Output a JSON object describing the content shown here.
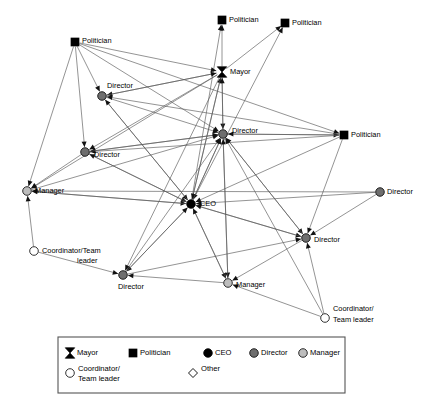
{
  "figure": {
    "type": "network-diagram",
    "title": "",
    "background_color": "#ffffff",
    "edge_color": "#5a5a5a"
  },
  "colors": {
    "mayor": "#000000",
    "politician": "#000000",
    "ceo": "#000000",
    "director": "#6e6e6e",
    "manager": "#bdbdbd",
    "coordinator": "#ffffff",
    "other": "#ffffff",
    "outline": "#000000",
    "edge": "#5a5a5a"
  },
  "nodes": [
    {
      "id": "pol_top",
      "label": "Politician",
      "role": "politician",
      "shape": "square",
      "x": 222,
      "y": 20,
      "label_dx": 7,
      "label_dy": 0,
      "anchor": "start"
    },
    {
      "id": "pol_topright",
      "label": "Politician",
      "role": "politician",
      "shape": "square",
      "x": 285,
      "y": 23,
      "label_dx": 7,
      "label_dy": 0,
      "anchor": "start"
    },
    {
      "id": "pol_left",
      "label": "Politician",
      "role": "politician",
      "shape": "square",
      "x": 75,
      "y": 42,
      "label_dx": 7,
      "label_dy": -1,
      "anchor": "start"
    },
    {
      "id": "mayor",
      "label": "Mayor",
      "role": "mayor",
      "shape": "hourglass",
      "x": 222,
      "y": 72,
      "label_dx": 8,
      "label_dy": 0,
      "anchor": "start"
    },
    {
      "id": "dir_upperleft",
      "label": "Director",
      "role": "director",
      "shape": "circle",
      "x": 102,
      "y": 96,
      "label_dx": 5,
      "label_dy": -10,
      "anchor": "start"
    },
    {
      "id": "dir_center",
      "label": "Director",
      "role": "director",
      "shape": "circle",
      "x": 223,
      "y": 134,
      "label_dx": 9,
      "label_dy": -3,
      "anchor": "start"
    },
    {
      "id": "pol_right",
      "label": "Politician",
      "role": "politician",
      "shape": "square",
      "x": 344,
      "y": 135,
      "label_dx": 7,
      "label_dy": 0,
      "anchor": "start"
    },
    {
      "id": "dir_left",
      "label": "Director",
      "role": "director",
      "shape": "circle",
      "x": 85,
      "y": 152,
      "label_dx": 9,
      "label_dy": 3,
      "anchor": "start"
    },
    {
      "id": "manager_left",
      "label": "Manager",
      "role": "manager",
      "shape": "circle",
      "x": 27,
      "y": 191,
      "label_dx": 8,
      "label_dy": 0,
      "anchor": "start"
    },
    {
      "id": "dir_farright",
      "label": "Director",
      "role": "director",
      "shape": "circle",
      "x": 380,
      "y": 192,
      "label_dx": 7,
      "label_dy": 0,
      "anchor": "start"
    },
    {
      "id": "ceo",
      "label": "CEO",
      "role": "ceo",
      "shape": "circle",
      "x": 191,
      "y": 204,
      "label_dx": 9,
      "label_dy": 0,
      "anchor": "start"
    },
    {
      "id": "dir_right",
      "label": "Director",
      "role": "director",
      "shape": "circle",
      "x": 306,
      "y": 238,
      "label_dx": 8,
      "label_dy": 2,
      "anchor": "start"
    },
    {
      "id": "coord_left",
      "label": "Coordinator/Team",
      "role": "coordinator",
      "shape": "circle",
      "x": 34,
      "y": 251,
      "label_dx": 8,
      "label_dy": 0,
      "anchor": "start",
      "label2": "leader",
      "label2_dx": 43,
      "label2_dy": 10
    },
    {
      "id": "dir_bottom",
      "label": "Director",
      "role": "director",
      "shape": "circle",
      "x": 123,
      "y": 275,
      "label_dx": -5,
      "label_dy": 12,
      "anchor": "start"
    },
    {
      "id": "manager_bottom",
      "label": "Manager",
      "role": "manager",
      "shape": "circle",
      "x": 228,
      "y": 283,
      "label_dx": 8,
      "label_dy": 2,
      "anchor": "start"
    },
    {
      "id": "coord_right",
      "label": "Coordinator/",
      "role": "coordinator",
      "shape": "circle",
      "x": 325,
      "y": 318,
      "label_dx": 8,
      "label_dy": -9,
      "anchor": "start",
      "label2": "Team leader",
      "label2_dx": 8,
      "label2_dy": 2
    }
  ],
  "edges": [
    {
      "from": "mayor",
      "to": "pol_top",
      "arrow": "to"
    },
    {
      "from": "mayor",
      "to": "pol_topright",
      "arrow": "to"
    },
    {
      "from": "ceo",
      "to": "pol_topright",
      "arrow": "to"
    },
    {
      "from": "ceo",
      "to": "mayor",
      "arrow": "to"
    },
    {
      "from": "ceo",
      "to": "pol_top",
      "arrow": "to"
    },
    {
      "from": "pol_left",
      "to": "mayor",
      "arrow": "to"
    },
    {
      "from": "pol_left",
      "to": "dir_upperleft",
      "arrow": "to"
    },
    {
      "from": "pol_left",
      "to": "dir_left",
      "arrow": "to"
    },
    {
      "from": "pol_left",
      "to": "manager_left",
      "arrow": "to"
    },
    {
      "from": "pol_left",
      "to": "dir_center",
      "arrow": "to"
    },
    {
      "from": "pol_left",
      "to": "pol_right",
      "arrow": "to"
    },
    {
      "from": "mayor",
      "to": "dir_upperleft",
      "arrow": "to"
    },
    {
      "from": "mayor",
      "to": "dir_center",
      "arrow": "to"
    },
    {
      "from": "mayor",
      "to": "dir_left",
      "arrow": "to"
    },
    {
      "from": "mayor",
      "to": "manager_left",
      "arrow": "to"
    },
    {
      "from": "mayor",
      "to": "ceo",
      "arrow": "to"
    },
    {
      "from": "mayor",
      "to": "dir_bottom",
      "arrow": "to"
    },
    {
      "from": "dir_upperleft",
      "to": "ceo",
      "arrow": "to"
    },
    {
      "from": "dir_upperleft",
      "to": "dir_center",
      "arrow": "to"
    },
    {
      "from": "dir_upperleft",
      "to": "mayor",
      "arrow": "to"
    },
    {
      "from": "dir_center",
      "to": "mayor",
      "arrow": "to"
    },
    {
      "from": "dir_center",
      "to": "ceo",
      "arrow": "to"
    },
    {
      "from": "dir_center",
      "to": "pol_right",
      "arrow": "to"
    },
    {
      "from": "dir_center",
      "to": "dir_left",
      "arrow": "to"
    },
    {
      "from": "dir_center",
      "to": "dir_right",
      "arrow": "to"
    },
    {
      "from": "dir_center",
      "to": "manager_bottom",
      "arrow": "to"
    },
    {
      "from": "pol_right",
      "to": "dir_center",
      "arrow": "to"
    },
    {
      "from": "pol_right",
      "to": "ceo",
      "arrow": "to"
    },
    {
      "from": "pol_right",
      "to": "dir_upperleft",
      "arrow": "to"
    },
    {
      "from": "pol_right",
      "to": "dir_left",
      "arrow": "to"
    },
    {
      "from": "pol_right",
      "to": "dir_right",
      "arrow": "to"
    },
    {
      "from": "dir_left",
      "to": "ceo",
      "arrow": "to"
    },
    {
      "from": "dir_left",
      "to": "dir_center",
      "arrow": "to"
    },
    {
      "from": "dir_left",
      "to": "manager_left",
      "arrow": "to"
    },
    {
      "from": "manager_left",
      "to": "ceo",
      "arrow": "to"
    },
    {
      "from": "manager_left",
      "to": "dir_center",
      "arrow": "to"
    },
    {
      "from": "dir_farright",
      "to": "ceo",
      "arrow": "to"
    },
    {
      "from": "dir_farright",
      "to": "manager_left",
      "arrow": "to"
    },
    {
      "from": "dir_farright",
      "to": "dir_right",
      "arrow": "to"
    },
    {
      "from": "ceo",
      "to": "dir_center",
      "arrow": "to"
    },
    {
      "from": "ceo",
      "to": "dir_right",
      "arrow": "to"
    },
    {
      "from": "ceo",
      "to": "dir_bottom",
      "arrow": "to"
    },
    {
      "from": "ceo",
      "to": "manager_bottom",
      "arrow": "to"
    },
    {
      "from": "ceo",
      "to": "dir_left",
      "arrow": "to"
    },
    {
      "from": "ceo",
      "to": "dir_upperleft",
      "arrow": "to"
    },
    {
      "from": "ceo",
      "to": "manager_left",
      "arrow": "to"
    },
    {
      "from": "dir_right",
      "to": "ceo",
      "arrow": "to"
    },
    {
      "from": "dir_right",
      "to": "dir_center",
      "arrow": "to"
    },
    {
      "from": "dir_right",
      "to": "manager_bottom",
      "arrow": "to"
    },
    {
      "from": "coord_left",
      "to": "manager_left",
      "arrow": "to"
    },
    {
      "from": "coord_left",
      "to": "dir_bottom",
      "arrow": "to"
    },
    {
      "from": "dir_bottom",
      "to": "ceo",
      "arrow": "to"
    },
    {
      "from": "dir_bottom",
      "to": "dir_center",
      "arrow": "to"
    },
    {
      "from": "dir_bottom",
      "to": "dir_right",
      "arrow": "to"
    },
    {
      "from": "manager_bottom",
      "to": "ceo",
      "arrow": "to"
    },
    {
      "from": "manager_bottom",
      "to": "dir_center",
      "arrow": "to"
    },
    {
      "from": "manager_bottom",
      "to": "dir_bottom",
      "arrow": "to"
    },
    {
      "from": "coord_right",
      "to": "manager_bottom",
      "arrow": "to"
    },
    {
      "from": "coord_right",
      "to": "dir_right",
      "arrow": "to"
    },
    {
      "from": "coord_right",
      "to": "dir_center",
      "arrow": "to"
    }
  ],
  "legend": {
    "box": {
      "x": 58,
      "y": 337,
      "width": 287,
      "height": 56
    },
    "row1": [
      {
        "key": "mayor",
        "label": "Mayor",
        "shape": "hourglass",
        "fill": "#000000"
      },
      {
        "key": "politician",
        "label": "Politician",
        "shape": "square",
        "fill": "#000000"
      },
      {
        "key": "ceo",
        "label": "CEO",
        "shape": "circle",
        "fill": "#000000"
      },
      {
        "key": "director",
        "label": "Director",
        "shape": "circle",
        "fill": "#6e6e6e"
      },
      {
        "key": "manager",
        "label": "Manager",
        "shape": "circle",
        "fill": "#bdbdbd"
      }
    ],
    "row2": [
      {
        "key": "coordinator",
        "label": "Coordinator/",
        "label_line2": "Team leader",
        "shape": "circle",
        "fill": "#ffffff"
      },
      {
        "key": "other",
        "label": "Other",
        "label_line2": "",
        "shape": "diamond",
        "fill": "#ffffff"
      }
    ]
  }
}
